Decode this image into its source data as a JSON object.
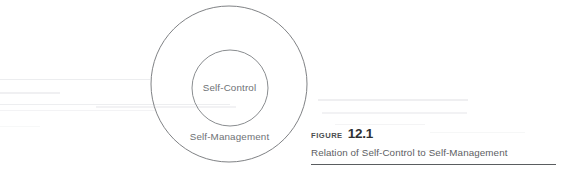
{
  "figure": {
    "diagram": {
      "outer_label": "Self-Management",
      "inner_label": "Self-Control",
      "outer_circle": {
        "cx": 229,
        "cy": 84,
        "r": 78,
        "stroke": "#808285"
      },
      "inner_circle": {
        "cx": 230,
        "cy": 88,
        "r": 38,
        "stroke": "#8a8d90"
      }
    },
    "caption": {
      "figure_word": "FIGURE",
      "figure_number": "12.1",
      "title": "Relation of Self-Control to Self-Management"
    }
  },
  "colors": {
    "background": "#ffffff",
    "stroke": "#808285",
    "label_text": "#6e7175",
    "caption_rule": "#5a5d60",
    "streak": "#e9eaec"
  }
}
